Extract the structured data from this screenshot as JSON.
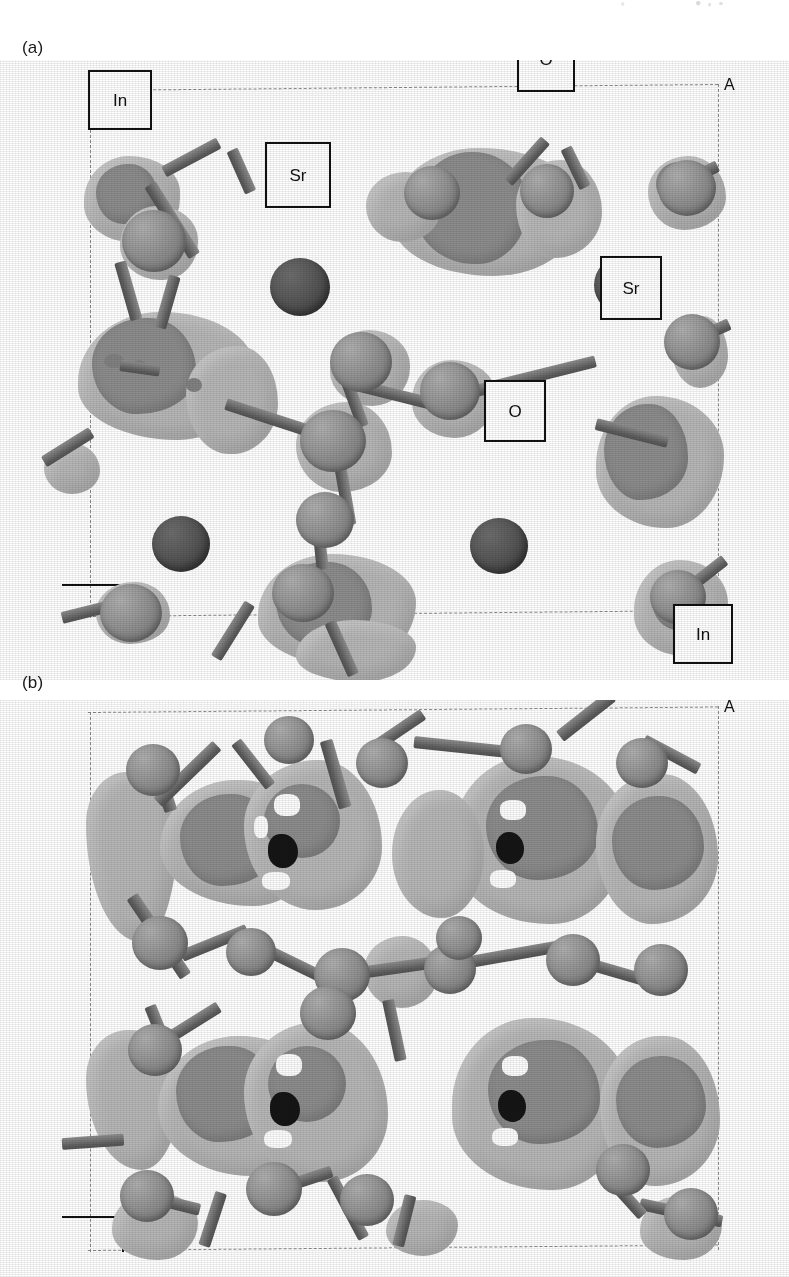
{
  "figure": {
    "type": "crystal-structure-charge-density-isosurface",
    "rendering": "grayscale ball-and-stick with charge density isosurface lobes",
    "panels": [
      {
        "id": "a",
        "letter": "(a)",
        "axis_letter": "A",
        "labels": [
          {
            "text": "In",
            "x": 88,
            "y": 70,
            "w": 60,
            "h": 56
          },
          {
            "text": "O",
            "x": 517,
            "y": 26,
            "w": 54,
            "h": 62
          },
          {
            "text": "Sr",
            "x": 265,
            "y": 142,
            "w": 62,
            "h": 62
          },
          {
            "text": "Sr",
            "x": 600,
            "y": 256,
            "w": 58,
            "h": 60
          },
          {
            "text": "O",
            "x": 484,
            "y": 380,
            "w": 58,
            "h": 58
          },
          {
            "text": "In",
            "x": 673,
            "y": 604,
            "w": 56,
            "h": 56
          }
        ]
      },
      {
        "id": "b",
        "letter": "(b)",
        "axis_letter": "A",
        "labels": []
      }
    ],
    "colors": {
      "background": "#ffffff",
      "sr_atom": "#4f4f4f",
      "framework_atom": "#8a8a8a",
      "bond": "#6f6f6f",
      "isosurface_outer": "#b7b7b7",
      "isosurface_inner": "#8d8d8d",
      "cell_boundary": "#8d8d8d",
      "label_border": "#111111",
      "text": "#111111"
    },
    "species": [
      "In",
      "O",
      "Sr"
    ]
  }
}
